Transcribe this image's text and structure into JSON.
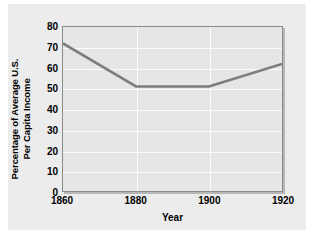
{
  "chart_data": {
    "type": "line",
    "title": "",
    "xlabel": "Year",
    "ylabel": "Percentage of Average U.S. Per Capita Income",
    "ylabel_line1": "Percentage of Average U.S.",
    "ylabel_line2": "Per Capita Income",
    "x": [
      1860,
      1880,
      1900,
      1920
    ],
    "values": [
      72,
      51,
      51,
      62
    ],
    "series": [
      {
        "name": "Percentage of Average U.S. Per Capita Income",
        "values": [
          72,
          51,
          51,
          62
        ]
      }
    ],
    "xticklabels": [
      "1860",
      "1880",
      "1900",
      "1920"
    ],
    "yticklabels": [
      "0",
      "10",
      "20",
      "30",
      "40",
      "50",
      "60",
      "70",
      "80"
    ],
    "ytickvalues": [
      0,
      10,
      20,
      30,
      40,
      50,
      60,
      70,
      80
    ],
    "xlim": [
      1860,
      1920
    ],
    "ylim": [
      0,
      80
    ],
    "grid": true,
    "legend": false,
    "line_color": "#7d7d7d",
    "plot_bg_color": "#e6e6e6",
    "gridline_color": "#fbfbfb",
    "panel_bg_color": "#ececec",
    "frame_color": "#8a8a8a",
    "text_color": "#000000"
  }
}
